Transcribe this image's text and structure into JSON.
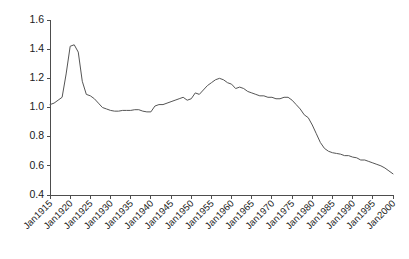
{
  "chart_data": {
    "type": "line",
    "title": "",
    "subtitle": "",
    "xlabel": "",
    "ylabel": "",
    "grid": false,
    "legend": "none",
    "xlim": [
      1915,
      2000
    ],
    "ylim": [
      0.4,
      1.6
    ],
    "ytick_labels": [
      "1.6",
      "1.4",
      "1.2",
      "1.0",
      "0.8",
      "0.6",
      "0.4"
    ],
    "ytick_values": [
      1.6,
      1.4,
      1.2,
      1.0,
      0.8,
      0.6,
      0.4
    ],
    "xtick_labels": [
      "Jan1915",
      "Jan1920",
      "Jan1925",
      "Jan1930",
      "Jan1935",
      "Jan1940",
      "Jan1945",
      "Jan1950",
      "Jan1955",
      "Jan1960",
      "Jan1965",
      "Jan1970",
      "Jan1975",
      "Jan1980",
      "Jan1985",
      "Jan1990",
      "Jan1995",
      "Jan2000"
    ],
    "xtick_values": [
      1915,
      1920,
      1925,
      1930,
      1935,
      1940,
      1945,
      1950,
      1955,
      1960,
      1965,
      1970,
      1975,
      1980,
      1985,
      1990,
      1995,
      2000
    ],
    "line_color": "#555555",
    "series": [
      {
        "name": "series-1",
        "x": [
          1915,
          1916,
          1917,
          1918,
          1919,
          1920,
          1921,
          1922,
          1923,
          1924,
          1925,
          1926,
          1927,
          1928,
          1929,
          1930,
          1931,
          1932,
          1933,
          1934,
          1935,
          1936,
          1937,
          1938,
          1939,
          1940,
          1941,
          1942,
          1943,
          1944,
          1945,
          1946,
          1947,
          1948,
          1949,
          1950,
          1951,
          1952,
          1953,
          1954,
          1955,
          1956,
          1957,
          1958,
          1959,
          1960,
          1961,
          1962,
          1963,
          1964,
          1965,
          1966,
          1967,
          1968,
          1969,
          1970,
          1971,
          1972,
          1973,
          1974,
          1975,
          1976,
          1977,
          1978,
          1979,
          1980,
          1981,
          1982,
          1983,
          1984,
          1985,
          1986,
          1987,
          1988,
          1989,
          1990,
          1991,
          1992,
          1993,
          1994,
          1995,
          1996,
          1997,
          1998,
          1999,
          2000
        ],
        "values": [
          1.02,
          1.03,
          1.05,
          1.07,
          1.23,
          1.42,
          1.43,
          1.38,
          1.18,
          1.09,
          1.08,
          1.06,
          1.03,
          1.0,
          0.99,
          0.98,
          0.975,
          0.975,
          0.98,
          0.98,
          0.98,
          0.985,
          0.985,
          0.975,
          0.97,
          0.97,
          1.01,
          1.02,
          1.02,
          1.03,
          1.04,
          1.05,
          1.06,
          1.07,
          1.05,
          1.06,
          1.1,
          1.09,
          1.12,
          1.15,
          1.17,
          1.19,
          1.2,
          1.19,
          1.17,
          1.16,
          1.13,
          1.14,
          1.13,
          1.11,
          1.1,
          1.09,
          1.08,
          1.08,
          1.07,
          1.07,
          1.06,
          1.06,
          1.07,
          1.07,
          1.05,
          1.02,
          0.99,
          0.95,
          0.93,
          0.88,
          0.82,
          0.76,
          0.72,
          0.7,
          0.69,
          0.685,
          0.68,
          0.67,
          0.67,
          0.66,
          0.655,
          0.64,
          0.64,
          0.63,
          0.62,
          0.61,
          0.6,
          0.585,
          0.565,
          0.545
        ]
      }
    ]
  },
  "axes": {
    "y_axis_name": "value-axis",
    "x_axis_name": "time-axis"
  }
}
